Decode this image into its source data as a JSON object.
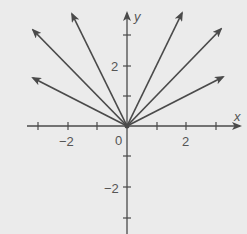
{
  "diagram": {
    "type": "coordinate-plane-rays",
    "axes": {
      "x_label": "x",
      "y_label": "y",
      "x_tick_labels": [
        {
          "value": -2,
          "label": "−2"
        },
        {
          "value": 2,
          "label": "2"
        }
      ],
      "y_tick_labels": [
        {
          "value": 2,
          "label": "2"
        },
        {
          "value": -2,
          "label": "−2"
        }
      ],
      "origin_label": "0",
      "x_ticks": [
        -3,
        -2,
        -1,
        1,
        2,
        3
      ],
      "y_ticks": [
        3,
        2,
        1,
        -1,
        -2,
        -3
      ]
    },
    "rays": [
      {
        "name": "ray-left-slope-half",
        "slope": -0.5,
        "end": [
          -3.2,
          1.6
        ]
      },
      {
        "name": "ray-left-slope-1",
        "slope": -1,
        "end": [
          -3.2,
          3.2
        ]
      },
      {
        "name": "ray-left-slope-2",
        "slope": -2,
        "end": [
          -1.85,
          3.7
        ]
      },
      {
        "name": "ray-right-slope-2",
        "slope": 2,
        "end": [
          1.85,
          3.7
        ]
      },
      {
        "name": "ray-right-slope-1",
        "slope": 1,
        "end": [
          3.2,
          3.2
        ]
      },
      {
        "name": "ray-right-slope-half",
        "slope": 0.5,
        "end": [
          3.25,
          1.63
        ]
      }
    ],
    "colors": {
      "background": "#ebebeb",
      "line": "#4a4a4a",
      "text": "#555555"
    }
  }
}
